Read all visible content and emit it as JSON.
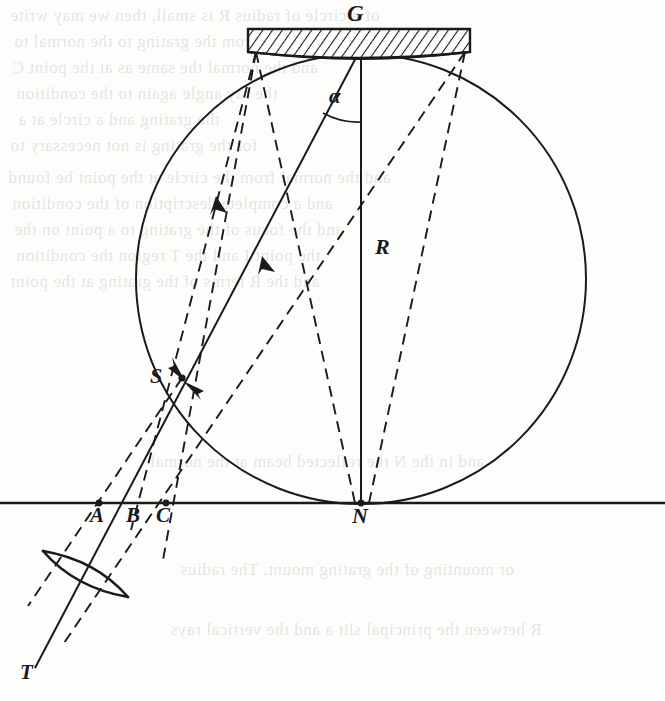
{
  "figure": {
    "background_color": "#fdfdfb",
    "ink_color": "#1a1a1a",
    "labels": {
      "grating": "G",
      "radius": "R",
      "slit_image": "S",
      "normal_foot": "N",
      "point_a": "A",
      "point_b": "B",
      "point_c": "C",
      "source": "T",
      "angle": "α"
    }
  },
  "geometry": {
    "circle": {
      "cx": 361,
      "cy": 279,
      "r": 225,
      "style": "solid",
      "name": "rowland-circle"
    },
    "baseline": {
      "x1": 0,
      "y1": 503,
      "x2": 665,
      "y2": 503,
      "style": "solid",
      "name": "horizontal-axis"
    },
    "grating_block": {
      "x": 248,
      "y": 29,
      "width": 222,
      "height": 21,
      "hatch": "diagonal",
      "name": "grating-block"
    },
    "grating_face": {
      "left_x": 252,
      "left_y": 50,
      "right_x": 468,
      "right_y": 50,
      "apex_x": 361,
      "apex_y": 56,
      "name": "grating-concave-face"
    },
    "points": [
      {
        "id": "G",
        "x": 361,
        "y": 54,
        "marked": false
      },
      {
        "id": "N",
        "x": 361,
        "y": 503,
        "marked": true
      },
      {
        "id": "S",
        "x": 182,
        "y": 378,
        "marked": true
      },
      {
        "id": "A",
        "x": 99,
        "y": 503,
        "marked": true
      },
      {
        "id": "B",
        "x": 137,
        "y": 503,
        "marked": false
      },
      {
        "id": "C",
        "x": 166,
        "y": 503,
        "marked": true
      },
      {
        "id": "T",
        "x": 33,
        "y": 655,
        "marked": false
      },
      {
        "id": "grating-left-edge",
        "x": 255,
        "y": 52,
        "marked": false
      },
      {
        "id": "grating-right-edge",
        "x": 465,
        "y": 52,
        "marked": false
      }
    ],
    "solid_rays": [
      {
        "name": "radius-G-to-N",
        "from": "G",
        "to": "N"
      },
      {
        "name": "ray-G-to-S-extended-to-T",
        "from": "G",
        "to": "T"
      }
    ],
    "dashed_rays": [
      {
        "name": "ray-left-edge-to-B",
        "from": "grating-left-edge",
        "to": "B",
        "arrow": true
      },
      {
        "name": "ray-left-edge-to-S",
        "from": "grating-left-edge",
        "to": "S"
      },
      {
        "name": "ray-right-edge-to-S",
        "from": "grating-right-edge",
        "to": "S",
        "arrow": true
      },
      {
        "name": "ray-right-edge-to-N",
        "from": "grating-right-edge",
        "to": "N"
      },
      {
        "name": "ray-left-edge-to-N",
        "from": "grating-left-edge",
        "to": "N"
      },
      {
        "name": "ray-S-to-A",
        "from": "S",
        "to": "A"
      },
      {
        "name": "ray-S-to-C-down",
        "from": "S",
        "to": "C"
      }
    ],
    "arrowheads": [
      {
        "name": "arrow-on-left-dashed-ray",
        "x": 222,
        "y": 205,
        "direction": "up-right"
      },
      {
        "name": "arrow-on-right-dashed-ray",
        "x": 269,
        "y": 265,
        "direction": "up-right"
      },
      {
        "name": "arrow-into-S-from-above",
        "x": 182,
        "y": 378,
        "direction": "down-right"
      },
      {
        "name": "arrow-into-S-from-below-right",
        "x": 182,
        "y": 378,
        "direction": "up-left"
      }
    ],
    "angle_arc": {
      "name": "alpha-angle-arc",
      "vertex": "G",
      "between": [
        "radius-G-to-N",
        "ray-G-to-S-extended-to-T"
      ],
      "radius_px": 72
    },
    "lens": {
      "name": "collimating-lens",
      "center_x": 85,
      "center_y": 574,
      "half_length": 47,
      "bulge": 13,
      "tilt_deg": 29
    }
  },
  "bleed_through_lines": [
    {
      "text": "of a circle of radius R is small, then we may write"
    },
    {
      "text": "and the distances from the grating to the normal to"
    },
    {
      "text": "and the normal the same as at the point C"
    },
    {
      "text": "the ray angle again to the condition"
    },
    {
      "text": "the grating and a circle at a"
    },
    {
      "text": "for the grating is not necessary to"
    },
    {
      "text": "and the normal from the circle at the point be found"
    },
    {
      "text": "and a complete description of the condition"
    },
    {
      "text": "and the focus of the grating to a point on the"
    },
    {
      "text": "the point  I  and the  T  region the condition"
    },
    {
      "text": "and the R terms of the grating at the point"
    },
    {
      "text": "and in the N the reflected  beam  at the normal"
    },
    {
      "text": "or mounting of the grating mount.  The radius"
    },
    {
      "text": "R  between the principal slit  a  and the vertical rays"
    }
  ]
}
